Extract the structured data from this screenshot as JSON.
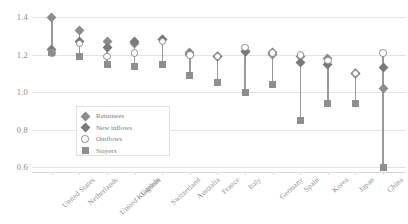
{
  "chart_data": {
    "type": "scatter",
    "title": "",
    "xlabel": "",
    "ylabel": "",
    "ylim": [
      0.6,
      1.45
    ],
    "yticks": [
      1.4,
      1.2,
      1.0,
      0.8,
      0.6
    ],
    "ytick_labels": [
      "1.4",
      "1.2",
      "1.0",
      "0.8",
      "0.6"
    ],
    "grid": true,
    "legend_position": "inside-lower-left",
    "categories": [
      "United States",
      "Netherlands",
      "United Kingdom",
      "Canada",
      "Switzerland",
      "Australia",
      "France",
      "Italy",
      "Germany",
      "Spain",
      "Korea",
      "Japan",
      "China"
    ],
    "series": [
      {
        "name": "Returnees",
        "marker": "diamond",
        "color": "#8c8c8c",
        "values": [
          1.4,
          1.33,
          1.27,
          1.26,
          1.28,
          1.21,
          1.19,
          1.22,
          1.2,
          1.19,
          1.18,
          1.1,
          1.02
        ]
      },
      {
        "name": "New inflows",
        "marker": "diamond-filled",
        "color": "#7a7a7a",
        "values": [
          1.23,
          1.27,
          1.24,
          1.27,
          1.28,
          1.2,
          1.19,
          1.22,
          1.21,
          1.16,
          1.15,
          1.1,
          1.13
        ]
      },
      {
        "name": "Outflows",
        "marker": "open-circle",
        "color": "#8a8a8a",
        "values": [
          1.21,
          1.26,
          1.19,
          1.21,
          1.27,
          1.2,
          1.19,
          1.24,
          1.21,
          1.2,
          1.17,
          1.1,
          1.21
        ]
      },
      {
        "name": "Stayers",
        "marker": "square",
        "color": "#8e8e8e",
        "values": [
          1.21,
          1.19,
          1.15,
          1.14,
          1.15,
          1.09,
          1.05,
          1.0,
          1.04,
          0.85,
          0.94,
          0.94,
          0.6
        ]
      }
    ]
  },
  "legend": {
    "items": [
      {
        "label": "Returnees",
        "marker": "diamond"
      },
      {
        "label": "New inflows",
        "marker": "diamond-filled"
      },
      {
        "label": "Outflows",
        "marker": "open-circle"
      },
      {
        "label": "Stayers",
        "marker": "square"
      }
    ]
  }
}
